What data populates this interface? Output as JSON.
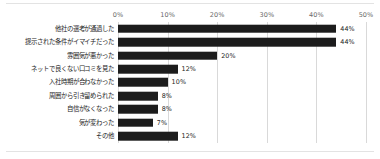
{
  "chart_data": {
    "type": "bar",
    "orientation": "horizontal",
    "title": "",
    "subtitle": "",
    "xlabel": "",
    "ylabel": "",
    "xlim": [
      0,
      50
    ],
    "xtick_labels": [
      "0%",
      "10%",
      "20%",
      "30%",
      "40%",
      "50%"
    ],
    "xticks": [
      0,
      10,
      20,
      30,
      40,
      50
    ],
    "grid": true,
    "legend": false,
    "bar_color": "#1c1c1c",
    "gridline_color": "#d9d9d9",
    "background_color": "#ffffff",
    "value_label_suffix": "%",
    "categories": [
      "他社の選考が通過した",
      "提示された条件がイマイチだった",
      "雰囲気が悪かった",
      "ネットで良くない口コミを見た",
      "入社時期が合わなかった",
      "周囲から引き留められた",
      "自信がなくなった",
      "気が変わった",
      "その他"
    ],
    "values": [
      44,
      44,
      20,
      12,
      10,
      8,
      8,
      7,
      12
    ],
    "value_labels": [
      "44%",
      "44%",
      "20%",
      "12%",
      "10%",
      "8%",
      "8%",
      "7%",
      "12%"
    ]
  }
}
